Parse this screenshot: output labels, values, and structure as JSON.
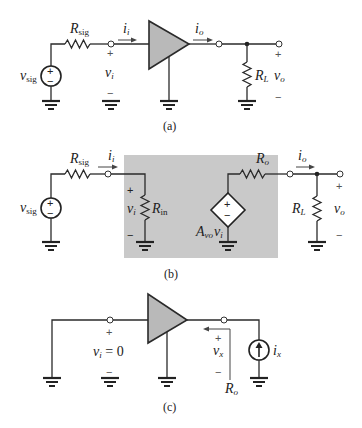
{
  "figure": {
    "panels": [
      {
        "id": "a",
        "caption": "(a)",
        "labels": {
          "source": {
            "main": "v",
            "sub": "sig"
          },
          "r_sig": {
            "main": "R",
            "sub": "sig"
          },
          "input_current": {
            "main": "i",
            "sub": "i"
          },
          "input_voltage": {
            "main": "v",
            "sub": "i"
          },
          "output_current": {
            "main": "i",
            "sub": "o"
          },
          "load": {
            "main": "R",
            "sub": "L"
          },
          "output_voltage": {
            "main": "v",
            "sub": "o"
          },
          "plus": "+",
          "minus": "−"
        }
      },
      {
        "id": "b",
        "caption": "(b)",
        "labels": {
          "source": {
            "main": "v",
            "sub": "sig"
          },
          "r_sig": {
            "main": "R",
            "sub": "sig"
          },
          "input_current": {
            "main": "i",
            "sub": "i"
          },
          "input_voltage": {
            "main": "v",
            "sub": "i"
          },
          "r_in": {
            "main": "R",
            "sub": "in"
          },
          "dependent_source": {
            "gain": "A",
            "gain_sub": "vo",
            "var": "v",
            "var_sub": "i"
          },
          "r_o": {
            "main": "R",
            "sub": "o"
          },
          "output_current": {
            "main": "i",
            "sub": "o"
          },
          "load": {
            "main": "R",
            "sub": "L"
          },
          "output_voltage": {
            "main": "v",
            "sub": "o"
          },
          "plus": "+",
          "minus": "−"
        }
      },
      {
        "id": "c",
        "caption": "(c)",
        "labels": {
          "input_voltage": {
            "main": "v",
            "sub": "i",
            "value": " = 0"
          },
          "test_voltage": {
            "main": "v",
            "sub": "x"
          },
          "test_current": {
            "main": "i",
            "sub": "x"
          },
          "r_o": {
            "main": "R",
            "sub": "o"
          },
          "plus": "+",
          "minus": "−"
        }
      }
    ],
    "colors": {
      "amplifier_fill": "#b9b9b9",
      "equivalent_box_fill": "#c9c9c9",
      "wire": "#2a2a2a"
    }
  }
}
